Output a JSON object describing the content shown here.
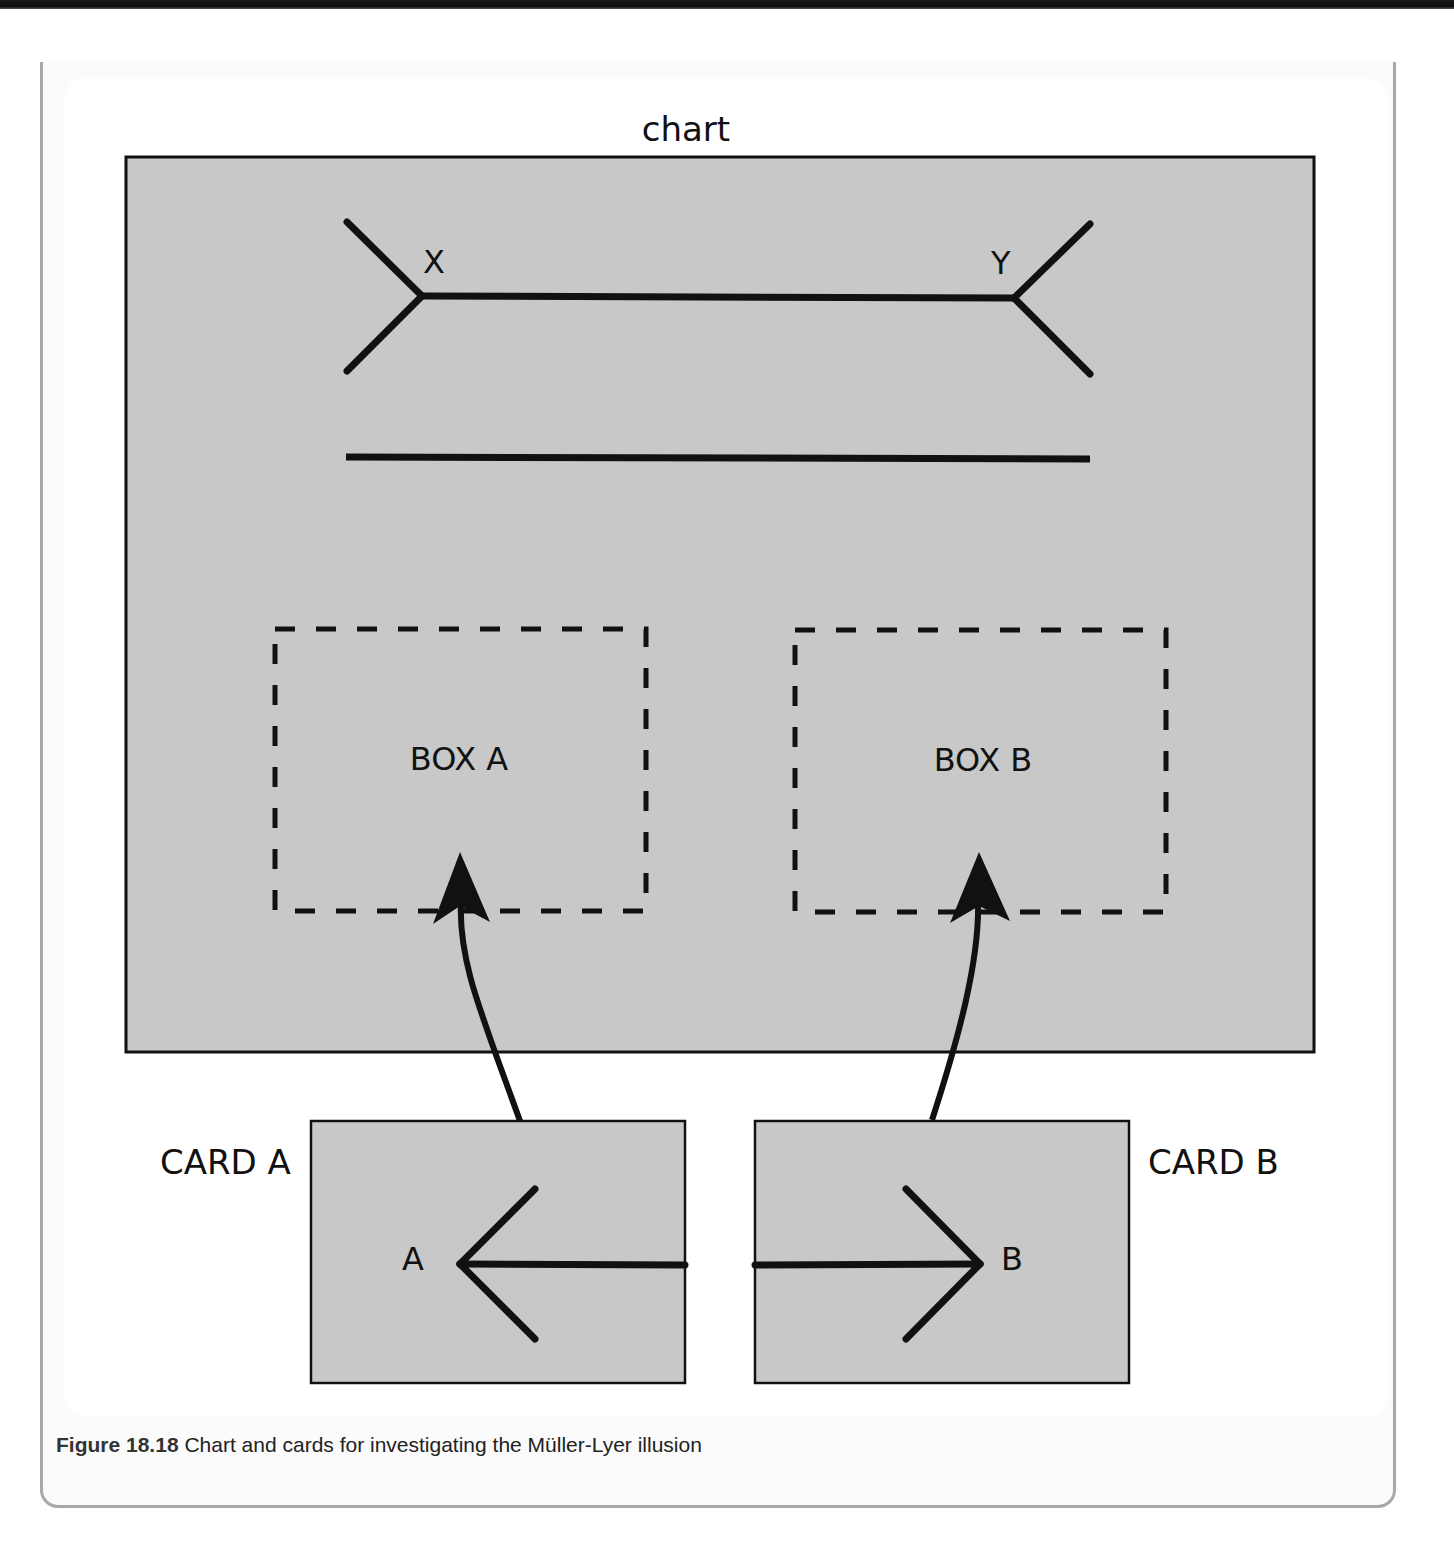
{
  "figure": {
    "number": "Figure 18.18",
    "caption": " Chart and cards for investigating the Müller-Lyer illusion"
  },
  "chart": {
    "title": "chart",
    "background": "#c8c8c8",
    "border_color": "#111111",
    "rect": {
      "x": 126,
      "y": 157,
      "w": 1188,
      "h": 895
    },
    "muller_lyer_line": {
      "label_left": "X",
      "label_right": "Y",
      "shaft": {
        "x1": 422,
        "y1": 296,
        "x2": 1014,
        "y2": 298
      },
      "left_fin_top": {
        "x1": 347,
        "y1": 222,
        "x2": 422,
        "y2": 296
      },
      "left_fin_bottom": {
        "x1": 422,
        "y1": 296,
        "x2": 347,
        "y2": 371
      },
      "right_fin_top": {
        "x1": 1090,
        "y1": 224,
        "x2": 1014,
        "y2": 298
      },
      "right_fin_bottom": {
        "x1": 1014,
        "y1": 298,
        "x2": 1090,
        "y2": 374
      }
    },
    "reference_line": {
      "x1": 346,
      "y1": 457,
      "x2": 1090,
      "y2": 459
    },
    "boxes": [
      {
        "label": "BOX A",
        "x": 274,
        "y": 628,
        "w": 372,
        "h": 284
      },
      {
        "label": "BOX B",
        "x": 794,
        "y": 629,
        "w": 372,
        "h": 284
      }
    ]
  },
  "cards": [
    {
      "title": "CARD A",
      "end_label": "A",
      "rect": {
        "x": 311,
        "y": 1121,
        "w": 374,
        "h": 262
      },
      "arrowhead_direction": "left"
    },
    {
      "title": "CARD B",
      "end_label": "B",
      "rect": {
        "x": 755,
        "y": 1121,
        "w": 374,
        "h": 262
      },
      "arrowhead_direction": "right"
    }
  ],
  "arrows": [
    {
      "from": "CARD A",
      "to": "BOX A"
    },
    {
      "from": "CARD B",
      "to": "BOX B"
    }
  ],
  "colors": {
    "panel_gray": "#c8c8c8",
    "ink": "#111111",
    "frame_border": "#a8a8a8"
  }
}
